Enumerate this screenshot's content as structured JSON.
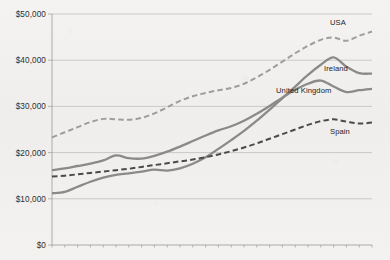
{
  "chart_data": {
    "type": "line",
    "title": "",
    "subtitle": "",
    "xlabel": "",
    "ylabel": "",
    "ylim": [
      0,
      50000
    ],
    "y_ticks": [
      0,
      10000,
      20000,
      30000,
      40000,
      50000
    ],
    "y_tick_labels": [
      "$0",
      "$10,000",
      "$20,000",
      "$30,000",
      "$40,000",
      "$50,000"
    ],
    "grid": "horizontal",
    "legend_position": "inline-right-of-series",
    "x": [
      1,
      2,
      3,
      4,
      5,
      6,
      7,
      8,
      9,
      10,
      11,
      12,
      13,
      14,
      15,
      16,
      17,
      18,
      19,
      20,
      21,
      22,
      23,
      24,
      25,
      26
    ],
    "series": [
      {
        "name": "USA",
        "style": "dashed",
        "color": "#9d9d9b",
        "label_x": 26,
        "values": [
          23300,
          24400,
          25500,
          26600,
          27300,
          27200,
          27100,
          27500,
          28500,
          29800,
          31200,
          32200,
          32900,
          33500,
          34000,
          34900,
          36300,
          37900,
          39700,
          41500,
          43100,
          44400,
          44900,
          44200,
          45300,
          46200
        ]
      },
      {
        "name": "Ireland",
        "style": "solid",
        "color": "#8a8a88",
        "label_x": 26,
        "values": [
          11200,
          11500,
          12600,
          13700,
          14600,
          15200,
          15500,
          15900,
          16300,
          16100,
          16600,
          17600,
          19000,
          20800,
          22700,
          24700,
          26900,
          29300,
          31800,
          34300,
          36800,
          39000,
          40600,
          38600,
          37200,
          37100
        ]
      },
      {
        "name": "United Kingdom",
        "style": "solid",
        "color": "#8a8a88",
        "label_x": 26,
        "values": [
          16200,
          16600,
          17100,
          17600,
          18300,
          19400,
          18800,
          18700,
          19300,
          20200,
          21300,
          22500,
          23700,
          24800,
          25700,
          26900,
          28400,
          30100,
          31900,
          33600,
          34900,
          35600,
          34300,
          33100,
          33500,
          33800
        ]
      },
      {
        "name": "Spain",
        "style": "dashed",
        "color": "#4a4a48",
        "label_x": 26,
        "values": [
          14800,
          15000,
          15300,
          15600,
          15900,
          16200,
          16500,
          16900,
          17300,
          17700,
          18100,
          18500,
          19000,
          19600,
          20300,
          21100,
          22000,
          23000,
          24000,
          25000,
          26000,
          26800,
          27200,
          26700,
          26300,
          26500
        ]
      }
    ]
  }
}
